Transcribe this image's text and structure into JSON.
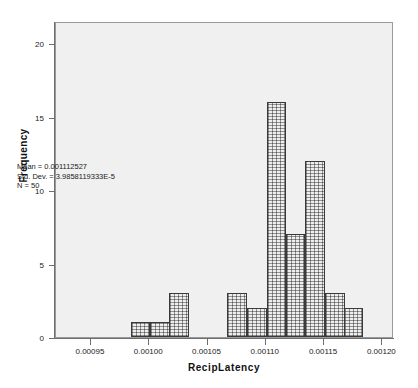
{
  "chart_data": {
    "type": "bar",
    "title": "",
    "xlabel": "RecipLatency",
    "ylabel": "Frequency",
    "xlim": [
      0.00092,
      0.00121
    ],
    "ylim": [
      0,
      21.5
    ],
    "grid": false,
    "legend": null,
    "x_ticks": [
      "0.00095",
      "0.00100",
      "0.00105",
      "0.00110",
      "0.00115",
      "0.00120"
    ],
    "x_tick_values": [
      0.00095,
      0.001,
      0.00105,
      0.0011,
      0.00115,
      0.0012
    ],
    "y_ticks": [
      "0",
      "5",
      "10",
      "15",
      "20"
    ],
    "y_tick_values": [
      0,
      5,
      10,
      15,
      20
    ],
    "bin_width": 1.67e-05,
    "bin_starts": [
      0.000984,
      0.001001,
      0.001017,
      0.001034,
      0.001051,
      0.001067,
      0.001084,
      0.001101,
      0.001117,
      0.001134,
      0.001151,
      0.001167
    ],
    "categories": [
      "0.000984",
      "0.001001",
      "0.001017",
      "0.001034",
      "0.001051",
      "0.001067",
      "0.001084",
      "0.001101",
      "0.001117",
      "0.001134",
      "0.001151",
      "0.001167"
    ],
    "values": [
      1,
      1,
      3,
      0,
      0,
      3,
      2,
      16,
      7,
      12,
      3,
      2
    ],
    "annotations": [
      "Mean = 0.001112527",
      "Std. Dev. = 3.9858119333E-5",
      "N = 50"
    ]
  },
  "stats": {
    "mean_label": "Mean = 0.001112527",
    "stddev_label": "Std. Dev. = 3.9858119333E-5",
    "n_label": "N = 50"
  },
  "axes": {
    "x_title": "RecipLatency",
    "y_title": "Frequency"
  },
  "colors": {
    "plot_background": "#f0f0f0",
    "page_background": "#ffffff",
    "bar_fill": "#eeeeee",
    "bar_border": "#3a3a3a",
    "axis": "#6e6e6e",
    "text": "#1a1a1a"
  }
}
